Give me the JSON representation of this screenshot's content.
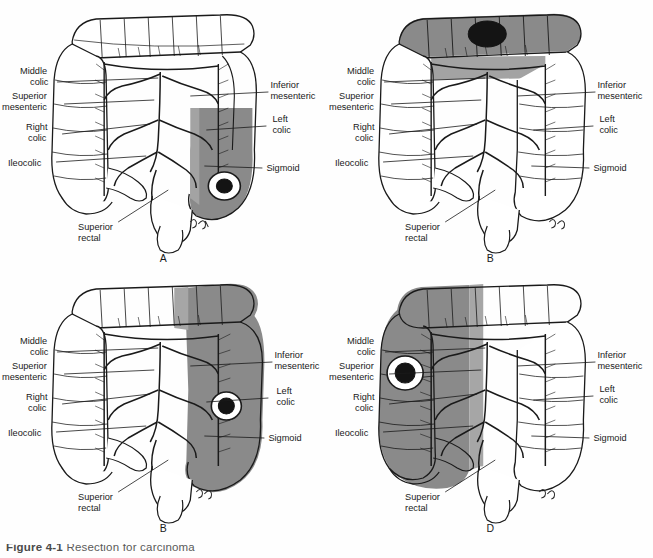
{
  "figure": {
    "background_color": "#fefefe",
    "ink_color": "#1a1a1a",
    "shade_color": "#8a8a8a",
    "shade_light_color": "#a8a8a8",
    "tumor_color": "#141414",
    "label_color": "#1a1a1a",
    "caption_label": "Figure 4-1",
    "caption_body": "Resection for carcinoma"
  },
  "labels": {
    "middle_colic": "Middle\ncolic",
    "middle_colic_l1": "Middle",
    "middle_colic_l2": "colic",
    "superior_mesenteric_l1": "Superior",
    "superior_mesenteric_l2": "mesenteric",
    "right_colic_l1": "Right",
    "right_colic_l2": "colic",
    "ileocolic": "Ileocolic",
    "inferior_mesenteric_l1": "Inferior",
    "inferior_mesenteric_l2": "mesenteric",
    "left_colic_l1": "Left",
    "left_colic_l2": "colic",
    "sigmoid": "Sigmoid",
    "superior_rectal_l1": "Superior",
    "superior_rectal_l2": "rectal"
  },
  "panels": [
    {
      "id": "panel-a",
      "letter": "A",
      "resection_region": "sigmoid and descending colon",
      "tumor_location": "sigmoid colon",
      "signature": "J. B."
    },
    {
      "id": "panel-b",
      "letter": "B",
      "resection_region": "transverse colon",
      "tumor_location": "mid transverse colon",
      "signature": "J. B."
    },
    {
      "id": "panel-c",
      "letter": "B",
      "resection_region": "left colon and splenic flexure",
      "tumor_location": "descending colon",
      "signature": "J. B."
    },
    {
      "id": "panel-d",
      "letter": "D",
      "resection_region": "right colon and ascending colon",
      "tumor_location": "hepatic flexure",
      "signature": "J. B."
    }
  ]
}
